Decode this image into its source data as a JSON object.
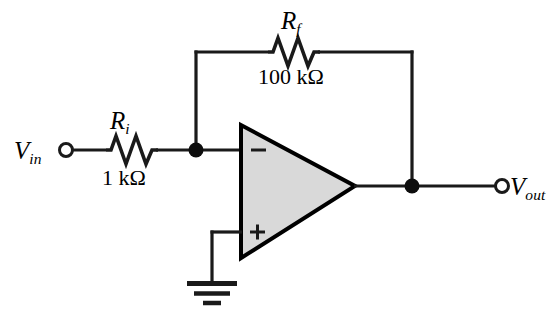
{
  "figure": {
    "background_color": "#ffffff",
    "wire_color": "#1a1a1a",
    "opamp_fill_color": "#d9d9d9",
    "opamp_stroke_color": "#000000"
  },
  "terminals": {
    "input": {
      "label_main": "V",
      "label_sub": "in",
      "terminal_type": "open-circle"
    },
    "output": {
      "label_main": "V",
      "label_sub": "out",
      "terminal_type": "open-circle"
    }
  },
  "components": {
    "feedback_resistor": {
      "designator_main": "R",
      "designator_sub": "f",
      "value": "100 kΩ",
      "type": "resistor"
    },
    "input_resistor": {
      "designator_main": "R",
      "designator_sub": "i",
      "value": "1 kΩ",
      "type": "resistor"
    },
    "opamp": {
      "inverting_input_label": "−",
      "noninverting_input_label": "+",
      "type": "operational-amplifier"
    },
    "ground": {
      "type": "earth-ground",
      "bar_count": 3
    }
  },
  "nodes": {
    "inverting_node": "junction-dot",
    "output_node": "junction-dot"
  }
}
